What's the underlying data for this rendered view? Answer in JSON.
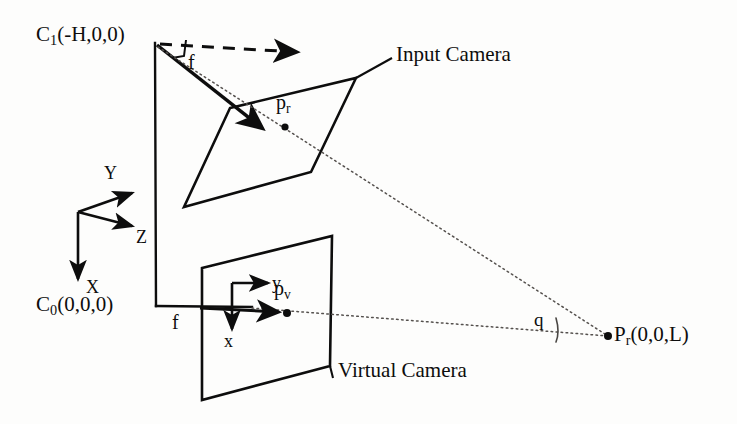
{
  "figure": {
    "type": "camera-geometry-diagram",
    "background_color": "#fdfdfc",
    "ink_color": "#0d0d0d"
  },
  "labels": {
    "input_camera_center": "C",
    "input_camera_center_sub": "1",
    "input_camera_center_coords": "(-H,0,0)",
    "virtual_camera_center": "C",
    "virtual_camera_center_sub": "0",
    "virtual_camera_center_coords": "(0,0,0)",
    "input_camera": "Input Camera",
    "virtual_camera": "Virtual Camera",
    "scene_point": "P",
    "scene_point_sub": "r",
    "scene_point_coords": "(0,0,L)",
    "image_point_input": "p",
    "image_point_input_sub": "r",
    "image_point_virtual": "p",
    "image_point_virtual_sub": "v",
    "focal_input": "f",
    "focal_virtual": "f",
    "angle": "q",
    "world_axis_x": "X",
    "world_axis_y": "Y",
    "world_axis_z": "Z",
    "image_axis_x": "x",
    "image_axis_y": "y"
  },
  "geometry": {
    "input_camera_center_px": [
      155,
      43
    ],
    "virtual_camera_center_px": [
      156,
      306
    ],
    "scene_point_px": [
      608,
      336
    ],
    "image_point_input_px": [
      285,
      127
    ],
    "image_point_virtual_px": [
      286,
      313
    ],
    "world_origin_px": [
      78,
      212
    ],
    "input_plane_corners_px": [
      [
        230,
        108
      ],
      [
        356,
        78
      ],
      [
        311,
        172
      ],
      [
        184,
        207
      ]
    ],
    "virtual_plane_corners_px": [
      [
        202,
        268
      ],
      [
        332,
        236
      ],
      [
        330,
        366
      ],
      [
        202,
        400
      ]
    ]
  }
}
